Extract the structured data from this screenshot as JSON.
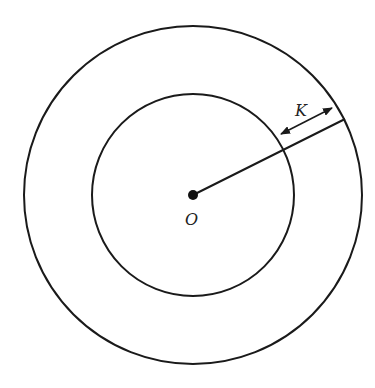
{
  "diagram": {
    "labels": {
      "center": "O",
      "gap": "K"
    },
    "geometry": {
      "center": [
        193,
        195
      ],
      "outer_radius": 169,
      "inner_radius": 101
    },
    "colors": {
      "stroke": "#1a1a1a",
      "background": "#ffffff"
    }
  }
}
